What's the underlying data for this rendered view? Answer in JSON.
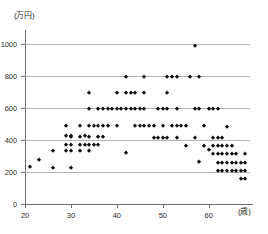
{
  "chart_data": {
    "type": "scatter",
    "title": "",
    "xlabel": "(歳)",
    "ylabel": "(万円)",
    "xlim": [
      20,
      69
    ],
    "ylim": [
      0,
      1080
    ],
    "grid": true,
    "legend": "none",
    "x_ticks": [
      20,
      30,
      40,
      50,
      60
    ],
    "y_ticks": [
      0,
      200,
      400,
      600,
      800,
      1000
    ],
    "gridline_values": [
      200,
      400,
      600,
      800,
      1000
    ],
    "x_tick_labels": [
      "20",
      "30",
      "40",
      "50",
      "60"
    ],
    "y_tick_labels": [
      "0",
      "200",
      "400",
      "600",
      "800",
      "1000"
    ],
    "points": [
      [
        21,
        230
      ],
      [
        23,
        275
      ],
      [
        26,
        225
      ],
      [
        26,
        330
      ],
      [
        29,
        330
      ],
      [
        29,
        370
      ],
      [
        29,
        425
      ],
      [
        29,
        490
      ],
      [
        30,
        225
      ],
      [
        30,
        330
      ],
      [
        30,
        370
      ],
      [
        30,
        420
      ],
      [
        30,
        425
      ],
      [
        32,
        330
      ],
      [
        32,
        370
      ],
      [
        32,
        420
      ],
      [
        32,
        490
      ],
      [
        33,
        370
      ],
      [
        33,
        425
      ],
      [
        34,
        330
      ],
      [
        34,
        370
      ],
      [
        34,
        420
      ],
      [
        34,
        490
      ],
      [
        34,
        590
      ],
      [
        34,
        695
      ],
      [
        35,
        370
      ],
      [
        35,
        490
      ],
      [
        36,
        370
      ],
      [
        36,
        420
      ],
      [
        36,
        490
      ],
      [
        36,
        590
      ],
      [
        37,
        420
      ],
      [
        37,
        490
      ],
      [
        37,
        590
      ],
      [
        38,
        490
      ],
      [
        38,
        590
      ],
      [
        39,
        590
      ],
      [
        40,
        490
      ],
      [
        40,
        590
      ],
      [
        40,
        695
      ],
      [
        41,
        590
      ],
      [
        42,
        320
      ],
      [
        42,
        590
      ],
      [
        42,
        695
      ],
      [
        42,
        790
      ],
      [
        43,
        590
      ],
      [
        43,
        695
      ],
      [
        44,
        490
      ],
      [
        44,
        590
      ],
      [
        44,
        695
      ],
      [
        45,
        490
      ],
      [
        45,
        590
      ],
      [
        46,
        490
      ],
      [
        46,
        590
      ],
      [
        46,
        695
      ],
      [
        46,
        790
      ],
      [
        47,
        490
      ],
      [
        48,
        415
      ],
      [
        48,
        490
      ],
      [
        49,
        415
      ],
      [
        49,
        590
      ],
      [
        50,
        415
      ],
      [
        50,
        490
      ],
      [
        50,
        590
      ],
      [
        51,
        415
      ],
      [
        51,
        590
      ],
      [
        51,
        695
      ],
      [
        51,
        790
      ],
      [
        52,
        490
      ],
      [
        52,
        790
      ],
      [
        53,
        415
      ],
      [
        53,
        490
      ],
      [
        53,
        590
      ],
      [
        53,
        790
      ],
      [
        54,
        490
      ],
      [
        55,
        360
      ],
      [
        55,
        490
      ],
      [
        56,
        790
      ],
      [
        57,
        415
      ],
      [
        57,
        590
      ],
      [
        57,
        985
      ],
      [
        58,
        260
      ],
      [
        58,
        590
      ],
      [
        58,
        790
      ],
      [
        59,
        360
      ],
      [
        59,
        490
      ],
      [
        60,
        340
      ],
      [
        60,
        590
      ],
      [
        61,
        310
      ],
      [
        61,
        360
      ],
      [
        61,
        410
      ],
      [
        61,
        590
      ],
      [
        62,
        205
      ],
      [
        62,
        255
      ],
      [
        62,
        310
      ],
      [
        62,
        360
      ],
      [
        62,
        410
      ],
      [
        62,
        590
      ],
      [
        63,
        205
      ],
      [
        63,
        255
      ],
      [
        63,
        310
      ],
      [
        63,
        360
      ],
      [
        63,
        410
      ],
      [
        64,
        205
      ],
      [
        64,
        255
      ],
      [
        64,
        310
      ],
      [
        64,
        360
      ],
      [
        64,
        480
      ],
      [
        65,
        205
      ],
      [
        65,
        255
      ],
      [
        65,
        310
      ],
      [
        65,
        360
      ],
      [
        66,
        205
      ],
      [
        66,
        255
      ],
      [
        66,
        310
      ],
      [
        67,
        155
      ],
      [
        67,
        205
      ],
      [
        67,
        255
      ],
      [
        68,
        155
      ],
      [
        68,
        205
      ],
      [
        68,
        255
      ],
      [
        68,
        310
      ]
    ]
  }
}
